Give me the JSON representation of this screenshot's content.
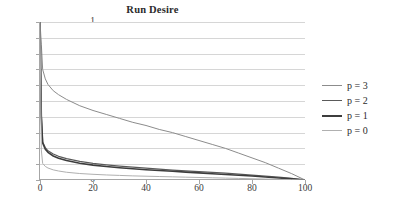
{
  "chart_data": {
    "type": "line",
    "title": "Run Desire",
    "xlabel": "",
    "ylabel": "",
    "xlim": [
      0,
      100
    ],
    "ylim": [
      0,
      1
    ],
    "grid": "horizontal",
    "legend_position": "right",
    "x_ticks": [
      "0",
      "20",
      "40",
      "60",
      "80",
      "100"
    ],
    "x_tick_values": [
      0,
      20,
      40,
      60,
      80,
      100
    ],
    "y_ticks": [
      "0",
      "0.1",
      "0.2",
      "0.3",
      "0.4",
      "0.5",
      "0.6",
      "0.7",
      "0.8",
      "0.9",
      "1"
    ],
    "y_tick_values": [
      0,
      0.1,
      0.2,
      0.3,
      0.4,
      0.5,
      0.6,
      0.7,
      0.8,
      0.9,
      1
    ],
    "x": [
      0,
      0.5,
      1,
      2,
      3,
      5,
      7,
      10,
      15,
      20,
      25,
      30,
      35,
      40,
      45,
      50,
      55,
      60,
      65,
      70,
      75,
      80,
      85,
      90,
      95,
      100
    ],
    "series": [
      {
        "name": "p = 3",
        "color": "#8c8c8c",
        "width": 1.0,
        "values": [
          1.0,
          0.86,
          0.7,
          0.64,
          0.605,
          0.565,
          0.54,
          0.51,
          0.47,
          0.44,
          0.415,
          0.39,
          0.365,
          0.345,
          0.32,
          0.3,
          0.275,
          0.25,
          0.225,
          0.2,
          0.17,
          0.14,
          0.11,
          0.075,
          0.04,
          0.0
        ]
      },
      {
        "name": "p = 2",
        "color": "#5a5a5a",
        "width": 1.2,
        "values": [
          1.0,
          0.42,
          0.24,
          0.205,
          0.185,
          0.165,
          0.15,
          0.135,
          0.118,
          0.105,
          0.096,
          0.088,
          0.081,
          0.075,
          0.069,
          0.063,
          0.058,
          0.053,
          0.048,
          0.043,
          0.037,
          0.031,
          0.025,
          0.018,
          0.01,
          0.0
        ]
      },
      {
        "name": "p = 1",
        "color": "#3d3d3d",
        "width": 1.6,
        "values": [
          1.0,
          0.4,
          0.235,
          0.195,
          0.175,
          0.152,
          0.138,
          0.123,
          0.106,
          0.094,
          0.085,
          0.078,
          0.071,
          0.065,
          0.06,
          0.055,
          0.05,
          0.045,
          0.04,
          0.035,
          0.03,
          0.025,
          0.019,
          0.013,
          0.007,
          0.0
        ]
      },
      {
        "name": "p = 0",
        "color": "#b0b0b0",
        "width": 1.0,
        "values": [
          1.0,
          0.19,
          0.105,
          0.086,
          0.076,
          0.064,
          0.057,
          0.049,
          0.041,
          0.036,
          0.032,
          0.029,
          0.026,
          0.024,
          0.022,
          0.02,
          0.018,
          0.016,
          0.014,
          0.012,
          0.01,
          0.008,
          0.006,
          0.004,
          0.002,
          0.0
        ]
      }
    ]
  }
}
